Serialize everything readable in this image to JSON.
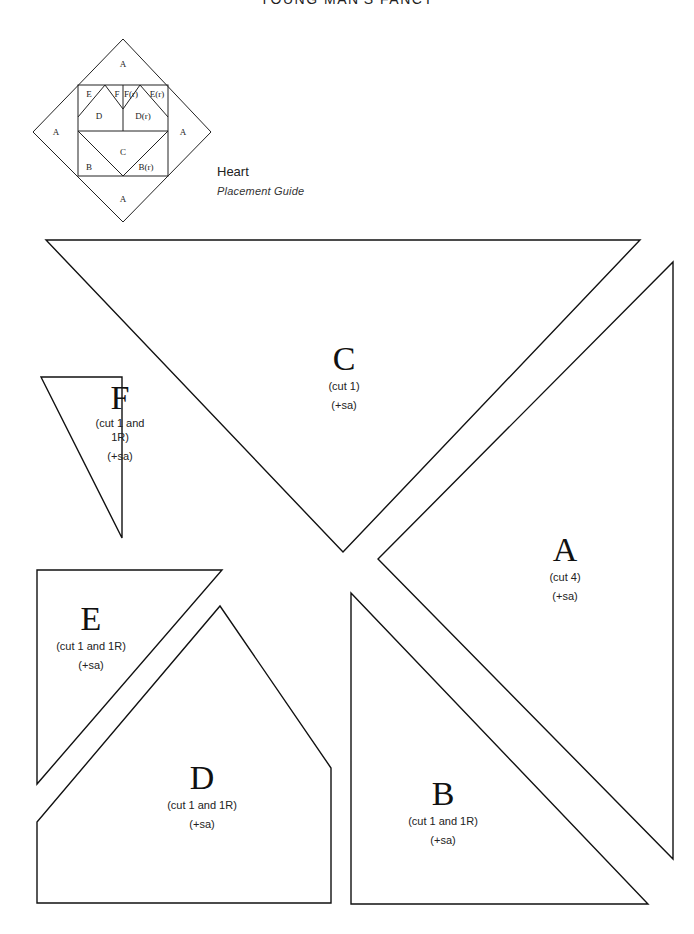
{
  "page": {
    "title": "YOUNG MAN'S FANCY"
  },
  "placement_guide": {
    "name": "Heart",
    "subtitle": "Placement Guide",
    "labels": {
      "a_top": "A",
      "a_left": "A",
      "a_right": "A",
      "a_bottom": "A",
      "e": "E",
      "f": "F",
      "fr": "F(r)",
      "er": "E(r)",
      "d": "D",
      "dr": "D(r)",
      "c": "C",
      "b": "B",
      "br": "B(r)"
    }
  },
  "pieces": {
    "c": {
      "letter": "C",
      "cut": "(cut 1)",
      "sa": "(+sa)"
    },
    "a": {
      "letter": "A",
      "cut": "(cut 4)",
      "sa": "(+sa)"
    },
    "f": {
      "letter": "F",
      "cut": "(cut 1 and 1R)",
      "sa": "(+sa)"
    },
    "e": {
      "letter": "E",
      "cut": "(cut 1 and 1R)",
      "sa": "(+sa)"
    },
    "d": {
      "letter": "D",
      "cut": "(cut 1 and 1R)",
      "sa": "(+sa)"
    },
    "b": {
      "letter": "B",
      "cut": "(cut 1 and 1R)",
      "sa": "(+sa)"
    }
  }
}
